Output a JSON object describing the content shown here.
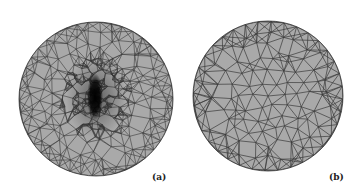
{
  "figure": {
    "panels": [
      {
        "id": "a",
        "label": "(a)",
        "description": "Refined triangular mesh on a disk with dense refinement around a vertical central feature"
      },
      {
        "id": "b",
        "label": "(b)",
        "description": "Coarse uniform triangular mesh on a disk"
      }
    ],
    "colors": {
      "fill": "#a9a9a9",
      "edge": "#3a3a3a",
      "dense": "#111111"
    }
  }
}
